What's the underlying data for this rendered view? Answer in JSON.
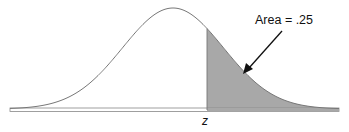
{
  "chart_data": {
    "type": "area",
    "title": "",
    "xlabel": "",
    "ylabel": "",
    "tick_labels": [
      "z"
    ],
    "annotation": "Area = .25",
    "shaded_region": {
      "from": "z",
      "to": "+inf",
      "area": 0.25
    },
    "z_value_approx": 0.674,
    "grid": false,
    "legend": null
  },
  "labels": {
    "annotation": "Area = .25",
    "z_tick": "z"
  },
  "colors": {
    "curve": "#777777",
    "shade": "#a8a8a8",
    "arrow": "#111111",
    "baseline": "#888888"
  }
}
